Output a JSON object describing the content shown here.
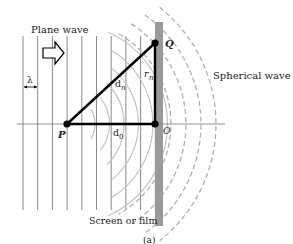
{
  "figure": {
    "caption": "(a)",
    "labels": {
      "plane_wave": "Plane wave",
      "spherical_wave": "Spherical wave",
      "screen": "Screen or film",
      "wavelength": "λ",
      "point_P": "P",
      "point_O": "O",
      "point_Q": "Q",
      "d_n_main": "d",
      "d_n_sub": "n",
      "d_0_main": "d",
      "d_0_sub": "0",
      "r_n_main": "r",
      "r_n_sub": "n"
    },
    "plane_wavefront_count": 10,
    "spherical_solid_arc_count": 6,
    "spherical_dashed_arc_count": 4,
    "colors": {
      "line": "#000000",
      "wavefront": "#8a8a8a",
      "screen": "#9a9a9a",
      "dashed": "#b0b0b0",
      "text": "#222222"
    }
  }
}
